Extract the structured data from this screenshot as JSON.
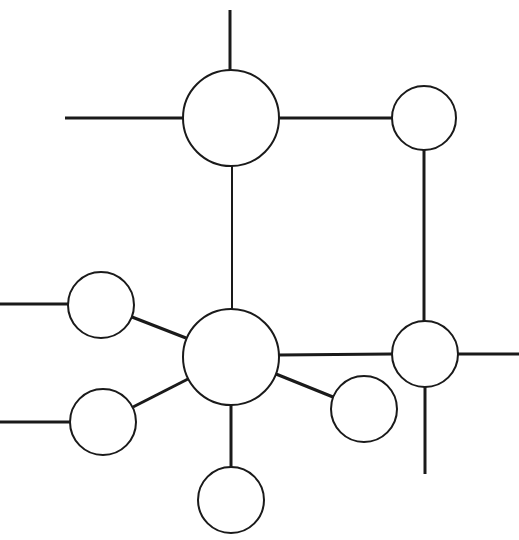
{
  "canvas": {
    "width": 519,
    "height": 540,
    "background": "#ffffff",
    "stroke_color": "#1a1a1a"
  },
  "diagram": {
    "type": "network-graph",
    "nodes": [
      {
        "id": "top-hub",
        "cx": 231,
        "cy": 118,
        "r": 48
      },
      {
        "id": "top-right",
        "cx": 424,
        "cy": 118,
        "r": 32
      },
      {
        "id": "center-hub",
        "cx": 231,
        "cy": 357,
        "r": 48
      },
      {
        "id": "upper-left",
        "cx": 101,
        "cy": 305,
        "r": 33
      },
      {
        "id": "lower-left",
        "cx": 103,
        "cy": 422,
        "r": 33
      },
      {
        "id": "bottom",
        "cx": 231,
        "cy": 500,
        "r": 33
      },
      {
        "id": "lower-right",
        "cx": 364,
        "cy": 409,
        "r": 33
      },
      {
        "id": "right",
        "cx": 425,
        "cy": 354,
        "r": 33
      }
    ],
    "edges": [
      {
        "id": "top-hub-up-stub",
        "x1": 230,
        "y1": 10,
        "x2": 230,
        "y2": 70,
        "w": 3
      },
      {
        "id": "top-hub-left-stub",
        "x1": 65,
        "y1": 118,
        "x2": 183,
        "y2": 118,
        "w": 3
      },
      {
        "id": "top-hub-to-top-right",
        "x1": 279,
        "y1": 118,
        "x2": 392,
        "y2": 118,
        "w": 3
      },
      {
        "id": "top-hub-to-center-hub",
        "x1": 232,
        "y1": 166,
        "x2": 232,
        "y2": 309,
        "w": 2
      },
      {
        "id": "top-right-to-right",
        "x1": 424,
        "y1": 150,
        "x2": 424,
        "y2": 321,
        "w": 3
      },
      {
        "id": "upper-left-left-stub",
        "x1": 0,
        "y1": 304,
        "x2": 68,
        "y2": 304,
        "w": 3
      },
      {
        "id": "upper-left-to-center-hub",
        "x1": 132,
        "y1": 317,
        "x2": 186,
        "y2": 338,
        "w": 3
      },
      {
        "id": "lower-left-left-stub",
        "x1": 0,
        "y1": 422,
        "x2": 70,
        "y2": 422,
        "w": 3
      },
      {
        "id": "lower-left-to-center-hub",
        "x1": 133,
        "y1": 407,
        "x2": 188,
        "y2": 379,
        "w": 3
      },
      {
        "id": "center-hub-to-bottom",
        "x1": 231,
        "y1": 405,
        "x2": 231,
        "y2": 467,
        "w": 3
      },
      {
        "id": "center-hub-to-lower-right",
        "x1": 276,
        "y1": 374,
        "x2": 333,
        "y2": 397,
        "w": 3
      },
      {
        "id": "center-hub-to-right",
        "x1": 279,
        "y1": 355,
        "x2": 392,
        "y2": 354,
        "w": 3
      },
      {
        "id": "right-right-stub",
        "x1": 458,
        "y1": 354,
        "x2": 519,
        "y2": 354,
        "w": 3
      },
      {
        "id": "right-down-stub",
        "x1": 425,
        "y1": 387,
        "x2": 425,
        "y2": 474,
        "w": 3
      }
    ]
  }
}
